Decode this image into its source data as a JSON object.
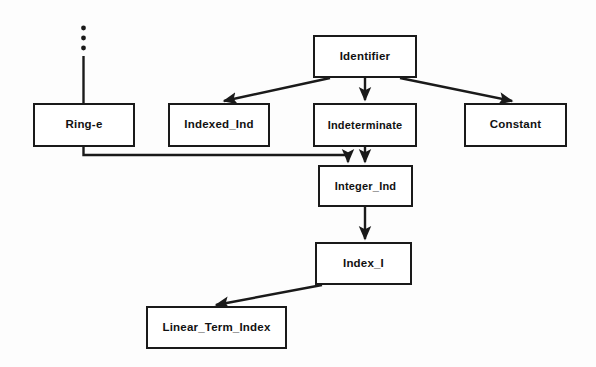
{
  "diagram": {
    "type": "directed-graph",
    "background_color": "#fdfdfd",
    "line_color": "#1a1a1a",
    "nodes": [
      {
        "id": "identifier",
        "label": "Identifier",
        "x": 313,
        "y": 35,
        "w": 104,
        "h": 43
      },
      {
        "id": "ring_e",
        "label": "Ring-e",
        "x": 33,
        "y": 103,
        "w": 102,
        "h": 44
      },
      {
        "id": "indexed_ind",
        "label": "Indexed_Ind",
        "x": 168,
        "y": 103,
        "w": 102,
        "h": 44
      },
      {
        "id": "indeterminate",
        "label": "Indeterminate",
        "x": 313,
        "y": 103,
        "w": 104,
        "h": 44
      },
      {
        "id": "constant",
        "label": "Constant",
        "x": 464,
        "y": 103,
        "w": 103,
        "h": 44
      },
      {
        "id": "integer_ind",
        "label": "Integer_Ind",
        "x": 318,
        "y": 165,
        "w": 95,
        "h": 42
      },
      {
        "id": "index_i",
        "label": "Index_I",
        "x": 315,
        "y": 242,
        "w": 97,
        "h": 43
      },
      {
        "id": "linear_term_index",
        "label": "Linear_Term_Index",
        "x": 146,
        "y": 306,
        "w": 141,
        "h": 43
      }
    ],
    "edges": [
      {
        "id": "edge-dotted-to-ring-e",
        "from": "(unspecified)",
        "to": "ring_e",
        "style": "dotted-then-solid",
        "arrow": false
      },
      {
        "id": "edge-identifier-indexed-ind",
        "from": "identifier",
        "to": "indexed_ind",
        "style": "solid",
        "arrow": true
      },
      {
        "id": "edge-identifier-indeterminate",
        "from": "identifier",
        "to": "indeterminate",
        "style": "solid",
        "arrow": true
      },
      {
        "id": "edge-identifier-constant",
        "from": "identifier",
        "to": "constant",
        "style": "solid",
        "arrow": true
      },
      {
        "id": "edge-ring-e-integer-ind",
        "from": "ring_e",
        "to": "integer_ind",
        "style": "orthogonal",
        "arrow": true
      },
      {
        "id": "edge-indeterminate-integer-ind",
        "from": "indeterminate",
        "to": "integer_ind",
        "style": "solid",
        "arrow": true
      },
      {
        "id": "edge-integer-ind-index-i",
        "from": "integer_ind",
        "to": "index_i",
        "style": "solid",
        "arrow": true
      },
      {
        "id": "edge-index-i-linear-term-index",
        "from": "index_i",
        "to": "linear_term_index",
        "style": "solid",
        "arrow": true
      }
    ]
  }
}
